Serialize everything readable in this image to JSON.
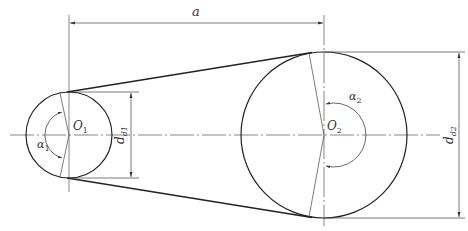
{
  "diagram": {
    "colors": {
      "background": "#ffffff",
      "outline": "#222222",
      "thin": "#444444",
      "text": "#333333"
    },
    "pulleys": [
      {
        "id": "small",
        "center_label": "O",
        "center_sub": "1",
        "cx": 69,
        "cy": 135,
        "r": 43,
        "diameter_label": "d",
        "diameter_sub": "d1",
        "angle_label": "α",
        "angle_sub": "1"
      },
      {
        "id": "large",
        "center_label": "O",
        "center_sub": "2",
        "cx": 324,
        "cy": 135,
        "r": 83,
        "diameter_label": "d",
        "diameter_sub": "d2",
        "angle_label": "α",
        "angle_sub": "2"
      }
    ],
    "center_distance": {
      "label": "a",
      "y": 23,
      "x1": 69,
      "x2": 324
    },
    "dimension_small": {
      "x": 131,
      "y1": 92,
      "y2": 178
    },
    "dimension_large": {
      "x": 459,
      "y1": 52,
      "y2": 218
    }
  }
}
